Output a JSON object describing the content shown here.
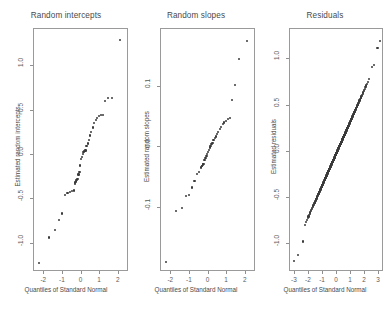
{
  "figure": {
    "background": "#ffffff",
    "point_color": "#3a3a3a",
    "axis_color": "#8f8f8f",
    "text_color": "#4a4a4a"
  },
  "chart_data": [
    {
      "type": "scatter",
      "title": "Random intercepts",
      "xlabel": "Quantiles of Standard Normal",
      "ylabel": "Estimated random intercepts",
      "xlim": [
        -2.55,
        2.55
      ],
      "ylim": [
        -1.32,
        1.42
      ],
      "xticks": [
        -2,
        -1,
        0,
        1,
        2
      ],
      "xticklabels": [
        "-2",
        "-1",
        "0",
        "1",
        "2"
      ],
      "yticks": [
        -1.0,
        -0.5,
        0.0,
        0.5,
        1.0
      ],
      "yticklabels": [
        "-1.0",
        "-0.5",
        "0.0",
        "0.5",
        "1.0"
      ],
      "grid": false,
      "legend": "none",
      "x": [
        -2.3,
        -1.73,
        -1.42,
        -1.21,
        -1.03,
        -0.88,
        -0.75,
        -0.62,
        -0.5,
        -0.39,
        -0.36,
        -0.33,
        -0.3,
        -0.27,
        -0.21,
        -0.16,
        -0.11,
        -0.06,
        -0.02,
        0.02,
        0.06,
        0.11,
        0.16,
        0.21,
        0.27,
        0.33,
        0.39,
        0.46,
        0.53,
        0.6,
        0.68,
        0.76,
        0.85,
        0.94,
        1.04,
        1.15,
        1.28,
        1.44,
        1.65,
        2.08
      ],
      "y": [
        -1.22,
        -0.93,
        -0.85,
        -0.73,
        -0.66,
        -0.45,
        -0.43,
        -0.42,
        -0.41,
        -0.4,
        -0.33,
        -0.31,
        -0.3,
        -0.28,
        -0.27,
        -0.22,
        -0.19,
        -0.12,
        -0.05,
        -0.02,
        0.01,
        0.03,
        0.04,
        0.05,
        0.1,
        0.13,
        0.17,
        0.22,
        0.26,
        0.31,
        0.36,
        0.39,
        0.42,
        0.44,
        0.45,
        0.45,
        0.61,
        0.64,
        0.64,
        1.3
      ]
    },
    {
      "type": "scatter",
      "title": "Random slopes",
      "xlabel": "Quantiles of Standard Normal",
      "ylabel": "Estimated random slopes",
      "xlim": [
        -2.55,
        2.55
      ],
      "ylim": [
        -0.205,
        0.195
      ],
      "xticks": [
        -2,
        -1,
        0,
        1,
        2
      ],
      "xticklabels": [
        "-2",
        "-1",
        "0",
        "1",
        "2"
      ],
      "yticks": [
        -0.1,
        0.0,
        0.1
      ],
      "yticklabels": [
        "-0.1",
        "0.0",
        "0.1"
      ],
      "grid": false,
      "legend": "none",
      "x": [
        -2.3,
        -1.73,
        -1.42,
        -1.21,
        -1.03,
        -0.88,
        -0.75,
        -0.62,
        -0.5,
        -0.39,
        -0.36,
        -0.33,
        -0.3,
        -0.27,
        -0.21,
        -0.16,
        -0.11,
        -0.06,
        -0.02,
        0.02,
        0.06,
        0.11,
        0.16,
        0.21,
        0.27,
        0.33,
        0.39,
        0.46,
        0.53,
        0.6,
        0.68,
        0.76,
        0.85,
        0.94,
        1.04,
        1.15,
        1.28,
        1.44,
        1.65,
        2.08
      ],
      "y": [
        -0.188,
        -0.104,
        -0.099,
        -0.08,
        -0.078,
        -0.066,
        -0.055,
        -0.044,
        -0.04,
        -0.033,
        -0.031,
        -0.03,
        -0.028,
        -0.027,
        -0.02,
        -0.017,
        -0.014,
        -0.011,
        -0.007,
        -0.004,
        0.0,
        0.003,
        0.006,
        0.008,
        0.012,
        0.015,
        0.018,
        0.022,
        0.026,
        0.03,
        0.034,
        0.038,
        0.041,
        0.044,
        0.047,
        0.049,
        0.078,
        0.103,
        0.145,
        0.175
      ]
    },
    {
      "type": "scatter",
      "title": "Residuals",
      "xlabel": "Quantiles of Standard Normal",
      "ylabel": "Estimated residuals",
      "xlim": [
        -3.35,
        3.35
      ],
      "ylim": [
        -1.3,
        1.33
      ],
      "xticks": [
        -3,
        -2,
        -1,
        0,
        1,
        2,
        3
      ],
      "xticklabels": [
        "-3",
        "-2",
        "-1",
        "0",
        "1",
        "2",
        "3"
      ],
      "yticks": [
        -1.0,
        -0.5,
        0.0,
        0.5,
        1.0
      ],
      "yticklabels": [
        "-1.0",
        "-0.5",
        "0.0",
        "0.5",
        "1.0"
      ],
      "grid": false,
      "legend": "none",
      "note": "dense quantile-quantile line of approximately 400 residual points",
      "n_points": 400,
      "slope": 0.345,
      "intercept": 0.0,
      "outliers": [
        {
          "x": -3.05,
          "y": -1.18
        },
        {
          "x": -2.78,
          "y": -1.12
        },
        {
          "x": -2.45,
          "y": -0.97
        },
        {
          "x": 2.5,
          "y": 0.92
        },
        {
          "x": 2.62,
          "y": 0.94
        },
        {
          "x": 2.88,
          "y": 1.12
        },
        {
          "x": 3.08,
          "y": 1.2
        }
      ]
    }
  ]
}
